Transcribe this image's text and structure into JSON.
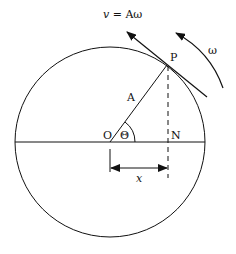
{
  "diagram": {
    "labels": {
      "velocity": "v = Aω",
      "velocity_v": "v",
      "velocity_eq": " = Aω",
      "omega": "ω",
      "point_p": "P",
      "radius": "A",
      "origin": "O",
      "angle": "Θ",
      "foot": "N",
      "displacement": "x"
    },
    "colors": {
      "stroke": "#111111",
      "background": "#ffffff"
    }
  }
}
